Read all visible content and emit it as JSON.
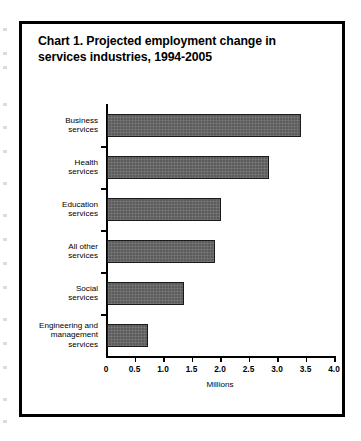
{
  "chart_title": "Chart 1. Projected employment change in services industries, 1994-2005",
  "axis_title": "Millions",
  "chart_data": {
    "type": "bar",
    "orientation": "horizontal",
    "title": "Chart 1. Projected employment change in services industries, 1994-2005",
    "xlabel": "Millions",
    "ylabel": "",
    "xlim": [
      0,
      4.0
    ],
    "grid": false,
    "legend": null,
    "categories": [
      "Business\nservices",
      "Health\nservices",
      "Education\nservices",
      "All other\nservices",
      "Social\nservices",
      "Engineering and\nmanagement\nservices"
    ],
    "values": [
      3.4,
      2.85,
      2.0,
      1.9,
      1.35,
      0.72
    ],
    "tick_values": [
      0,
      0.5,
      1.0,
      1.5,
      2.0,
      2.5,
      3.0,
      3.5,
      4.0
    ],
    "tick_labels": [
      "0",
      "0.5",
      "1.0",
      "1.5",
      "2.0",
      "2.5",
      "3.0",
      "3.5",
      "4.0"
    ],
    "bar_color": "#5c5c5c",
    "bar_edge_color": "#1a1a1a",
    "background_color": "#ffffff",
    "frame_color": "#000000"
  }
}
